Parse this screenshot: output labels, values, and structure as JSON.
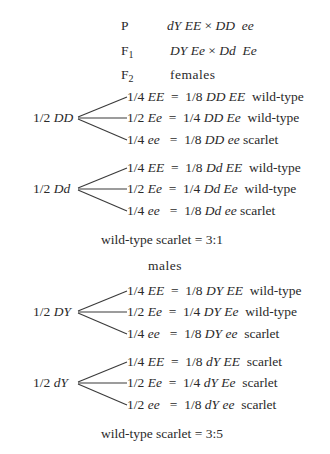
{
  "header": {
    "p_label": "P",
    "p_cross_left": "dY EE",
    "p_cross_times": "×",
    "p_cross_right": "DD  ee",
    "f1_label_main": "F",
    "f1_label_sub": "1",
    "f1_cross_left": "DY Ee",
    "f1_cross_times": "×",
    "f1_cross_right": "Dd  Ee",
    "f2_label_main": "F",
    "f2_label_sub": "2",
    "f2_section": "females"
  },
  "females": {
    "groups": [
      {
        "parent": "1/2",
        "parent_geno": "DD",
        "branches": [
          {
            "frac": "1/4",
            "geno": "EE",
            "eq": "=",
            "result": "1/8",
            "result_geno": "DD EE",
            "phenotype": "wild-type"
          },
          {
            "frac": "1/2",
            "geno": "Ee",
            "eq": "=",
            "result": "1/4",
            "result_geno": "DD Ee",
            "phenotype": "wild-type"
          },
          {
            "frac": "1/4",
            "geno": "ee",
            "eq": "=",
            "result": "1/8",
            "result_geno": "DD ee",
            "phenotype": "scarlet"
          }
        ]
      },
      {
        "parent": "1/2",
        "parent_geno": "Dd",
        "branches": [
          {
            "frac": "1/4",
            "geno": "EE",
            "eq": "=",
            "result": "1/8",
            "result_geno": "Dd EE",
            "phenotype": "wild-type"
          },
          {
            "frac": "1/2",
            "geno": "Ee",
            "eq": "=",
            "result": "1/4",
            "result_geno": "Dd Ee",
            "phenotype": "wild-type"
          },
          {
            "frac": "1/4",
            "geno": "ee",
            "eq": "=",
            "result": "1/8",
            "result_geno": "Dd ee",
            "phenotype": "scarlet"
          }
        ]
      }
    ],
    "ratio": "wild-type scarlet = 3:1"
  },
  "males": {
    "title": "males",
    "groups": [
      {
        "parent": "1/2",
        "parent_geno": "DY",
        "branches": [
          {
            "frac": "1/4",
            "geno": "EE",
            "eq": "=",
            "result": "1/8",
            "result_geno": "DY EE",
            "phenotype": "wild-type"
          },
          {
            "frac": "1/2",
            "geno": "Ee",
            "eq": "=",
            "result": "1/4",
            "result_geno": "DY Ee",
            "phenotype": "wild-type"
          },
          {
            "frac": "1/4",
            "geno": "ee",
            "eq": "=",
            "result": "1/8",
            "result_geno": "DY ee",
            "phenotype": "scarlet"
          }
        ]
      },
      {
        "parent": "1/2",
        "parent_geno": "dY",
        "branches": [
          {
            "frac": "1/4",
            "geno": "EE",
            "eq": "=",
            "result": "1/8",
            "result_geno": "dY EE",
            "phenotype": "scarlet"
          },
          {
            "frac": "1/2",
            "geno": "Ee",
            "eq": "=",
            "result": "1/4",
            "result_geno": "dY Ee",
            "phenotype": "scarlet"
          },
          {
            "frac": "1/2",
            "geno": "ee",
            "eq": "=",
            "result": "1/8",
            "result_geno": "dY ee",
            "phenotype": "scarlet"
          }
        ]
      }
    ],
    "ratio": "wild-type scarlet = 3:5"
  }
}
